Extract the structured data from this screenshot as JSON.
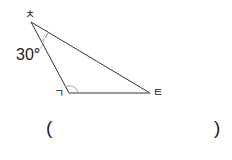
{
  "diagram": {
    "type": "triangle",
    "vertices": [
      {
        "label": "ㅊ",
        "position": "top-left"
      },
      {
        "label": "ㄱ",
        "position": "bottom-left"
      },
      {
        "label": "ㅌ",
        "position": "bottom-right"
      }
    ],
    "angles": [
      {
        "vertex": "ㅊ",
        "value": "30°"
      },
      {
        "vertex": "ㄱ",
        "value": "",
        "marked": true
      }
    ],
    "answer": {
      "open": "(",
      "close": ")",
      "value": ""
    }
  },
  "colors": {
    "line": "#333333",
    "arc": "#888888",
    "text": "#222222",
    "background": "#ffffff"
  }
}
